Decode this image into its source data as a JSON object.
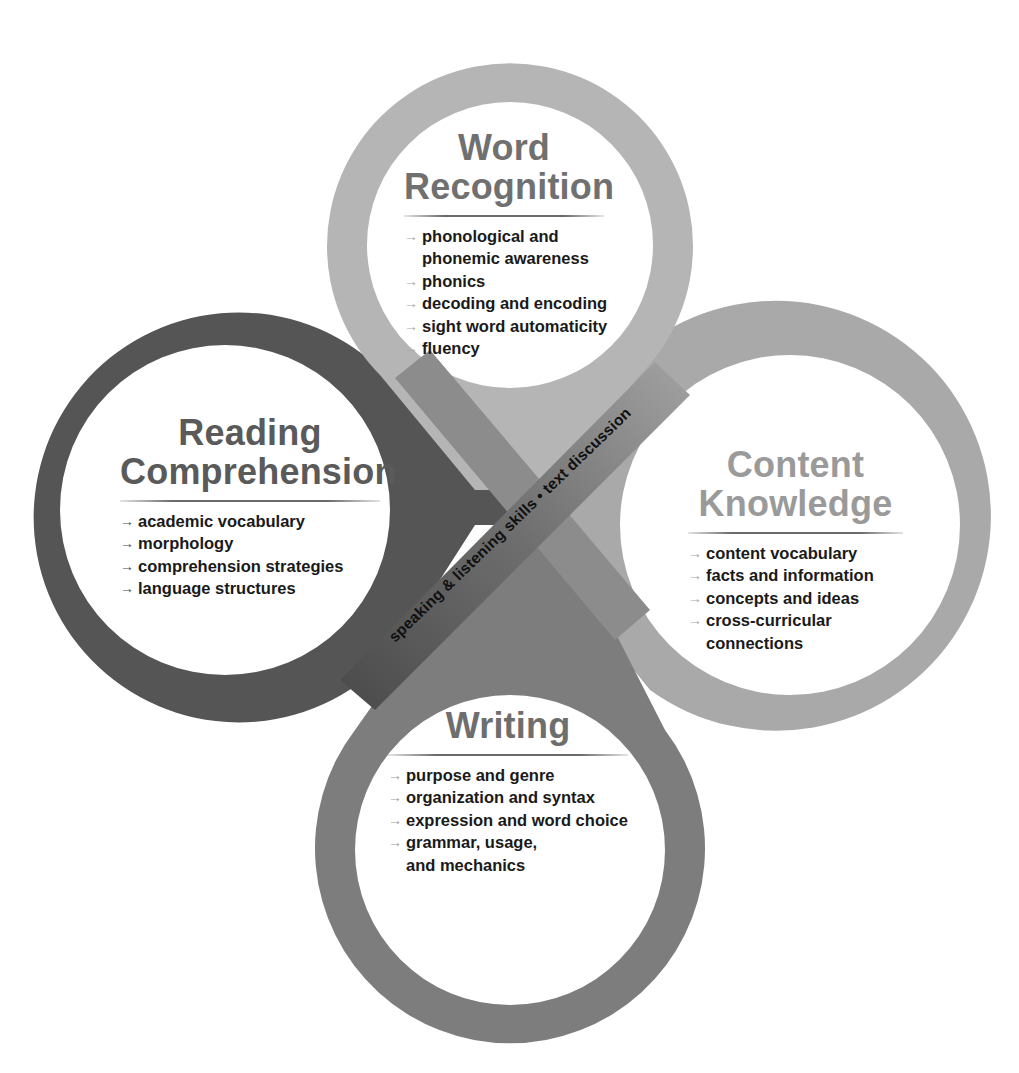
{
  "colors": {
    "word_recognition_loop": "#b5b5b5",
    "reading_comprehension_loop": "#555555",
    "content_knowledge_loop": "#a9a9a9",
    "writing_loop": "#7d7d7d",
    "background": "#ffffff"
  },
  "center_band": {
    "label": "speaking & listening skills • text discussion"
  },
  "loops": {
    "word_recognition": {
      "title_line1": "Word",
      "title_line2": "Recognition",
      "items": [
        {
          "line1": "phonological and",
          "line2": "phonemic awareness"
        },
        {
          "line1": "phonics"
        },
        {
          "line1": "decoding and encoding"
        },
        {
          "line1": "sight word automaticity"
        },
        {
          "line1": "fluency"
        }
      ]
    },
    "reading_comprehension": {
      "title_line1": "Reading",
      "title_line2": "Comprehension",
      "items": [
        {
          "line1": "academic vocabulary"
        },
        {
          "line1": "morphology"
        },
        {
          "line1": "comprehension strategies"
        },
        {
          "line1": "language structures"
        }
      ]
    },
    "content_knowledge": {
      "title_line1": "Content",
      "title_line2": "Knowledge",
      "items": [
        {
          "line1": "content vocabulary"
        },
        {
          "line1": "facts and information"
        },
        {
          "line1": "concepts and ideas"
        },
        {
          "line1": "cross-curricular",
          "line2": "connections"
        }
      ]
    },
    "writing": {
      "title_line1": "Writing",
      "items": [
        {
          "line1": "purpose and genre"
        },
        {
          "line1": "organization and syntax"
        },
        {
          "line1": "expression and word choice"
        },
        {
          "line1": "grammar, usage,",
          "line2": "and mechanics"
        }
      ]
    }
  },
  "icons": {
    "bullet_arrow": "→"
  }
}
